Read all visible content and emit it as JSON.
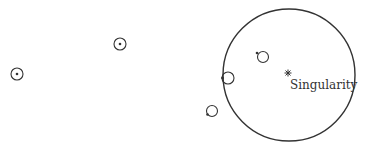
{
  "diagram": {
    "title": "",
    "colors": {
      "stroke": "#333333",
      "background": "#ffffff"
    },
    "event_horizon": {
      "cx": 289,
      "cy": 75,
      "r": 66
    },
    "singularity": {
      "x": 288,
      "y": 73,
      "label": "Singularity",
      "marker": "asterisk"
    },
    "particles": [
      {
        "id": "far-left",
        "cx": 17,
        "cy": 74,
        "r": 6,
        "dot_x": 17,
        "dot_y": 74
      },
      {
        "id": "far-top",
        "cx": 120,
        "cy": 44,
        "r": 6,
        "dot_x": 120,
        "dot_y": 44
      },
      {
        "id": "outside-near",
        "cx": 212,
        "cy": 111,
        "r": 5.5,
        "dot_x": 207.5,
        "dot_y": 114.5
      },
      {
        "id": "on-horizon",
        "cx": 228,
        "cy": 78,
        "r": 6,
        "dot_x": 222.5,
        "dot_y": 78
      },
      {
        "id": "inside",
        "cx": 263,
        "cy": 57,
        "r": 5.5,
        "dot_x": 257,
        "dot_y": 53
      }
    ]
  }
}
